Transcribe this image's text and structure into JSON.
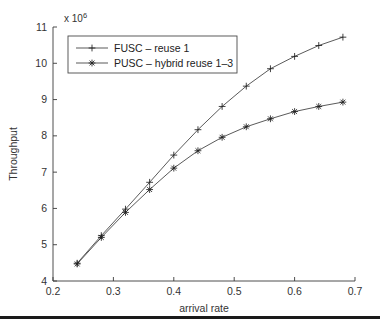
{
  "chart_data": {
    "type": "line",
    "title": "",
    "xlabel": "arrival rate",
    "ylabel": "Throughput",
    "y_exponent_label": "x 10",
    "y_exponent_power": "6",
    "xlim": [
      0.2,
      0.7
    ],
    "ylim": [
      4,
      11
    ],
    "x_ticks": [
      "0.2",
      "0.3",
      "0.4",
      "0.5",
      "0.6",
      "0.7"
    ],
    "x_tick_values": [
      0.2,
      0.3,
      0.4,
      0.5,
      0.6,
      0.7
    ],
    "y_ticks": [
      "4",
      "5",
      "6",
      "7",
      "8",
      "9",
      "10",
      "11"
    ],
    "y_tick_values": [
      4,
      5,
      6,
      7,
      8,
      9,
      10,
      11
    ],
    "grid": false,
    "legend_position": "upper left",
    "x": [
      0.24,
      0.28,
      0.32,
      0.36,
      0.4,
      0.44,
      0.48,
      0.52,
      0.56,
      0.6,
      0.64,
      0.68
    ],
    "series": [
      {
        "name": "FUSC – reuse 1",
        "marker": "plus",
        "values": [
          4.49,
          5.25,
          5.98,
          6.72,
          7.47,
          8.17,
          8.81,
          9.37,
          9.85,
          10.19,
          10.49,
          10.72
        ]
      },
      {
        "name": "PUSC – hybrid reuse 1–3",
        "marker": "star",
        "values": [
          4.47,
          5.2,
          5.89,
          6.52,
          7.11,
          7.59,
          7.96,
          8.25,
          8.47,
          8.67,
          8.81,
          8.93
        ]
      }
    ]
  },
  "legend": {
    "entries": [
      {
        "label": "FUSC – reuse 1"
      },
      {
        "label": "PUSC – hybrid reuse 1–3"
      }
    ]
  }
}
